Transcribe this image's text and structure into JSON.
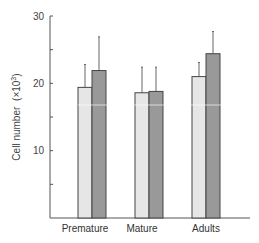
{
  "chart_data": {
    "type": "bar",
    "title": "",
    "xlabel": "",
    "ylabel": "Cell number (×10³)",
    "ylim": [
      0,
      30
    ],
    "yticks": [
      10,
      20,
      30
    ],
    "grid": false,
    "legend": null,
    "categories": [
      "Premature",
      "Mature",
      "Adults"
    ],
    "series": [
      {
        "name": "Series 1 (light)",
        "color": "#e6e6e6",
        "values": [
          19.4,
          18.6,
          21.0
        ],
        "error_upper": [
          22.8,
          22.4,
          23.1
        ]
      },
      {
        "name": "Series 2 (dark)",
        "color": "#999999",
        "values": [
          21.9,
          18.8,
          24.4
        ],
        "error_upper": [
          26.9,
          22.4,
          27.7
        ]
      }
    ]
  },
  "labels": {
    "y_axis": "Cell number",
    "y_axis_unit": "(×10",
    "y_axis_exp": "3",
    "y_axis_close": ")",
    "ticks": [
      "10",
      "20",
      "30"
    ],
    "categories": [
      "Premature",
      "Mature",
      "Adults"
    ]
  }
}
